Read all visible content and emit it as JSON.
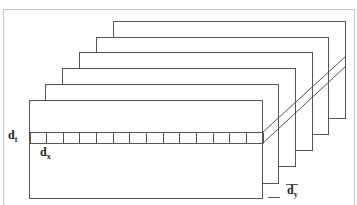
{
  "diagram": {
    "type": "stacked-layers",
    "layer_count": 6,
    "cell_count": 14,
    "labels": {
      "dt": {
        "main": "d",
        "sub": "t"
      },
      "dx": {
        "main": "d",
        "sub": "x"
      },
      "dy": {
        "main": "d",
        "sub": "y"
      }
    },
    "colors": {
      "line": "#555555",
      "background": "#ffffff",
      "text": "#222222"
    }
  }
}
